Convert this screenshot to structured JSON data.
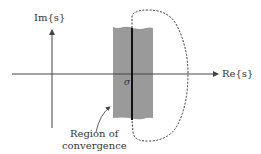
{
  "diagram": {
    "axes": {
      "vertical_label": "Im{s}",
      "horizontal_label": "Re{s}"
    },
    "sigma_label": "σ",
    "region_label_line1": "Region of",
    "region_label_line2": "convergence",
    "colors": {
      "band": "#9a9a9a",
      "axis": "#444444",
      "contour": "#333333",
      "sigma_line": "#111111"
    }
  }
}
